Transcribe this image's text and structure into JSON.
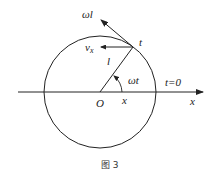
{
  "diagram": {
    "caption": "图 3",
    "labels": {
      "tangent_velocity": "ωl",
      "x_velocity": "v",
      "x_velocity_sub": "x",
      "point": "t",
      "radius": "l",
      "angle": "ωt",
      "initial": "t=0",
      "origin": "O",
      "projection": "x",
      "axis": "x"
    },
    "geometry": {
      "center": [
        100,
        92
      ],
      "radius": 56,
      "point_t": [
        133,
        47
      ],
      "axis_from": [
        18,
        92
      ],
      "axis_to": [
        203,
        92
      ]
    },
    "colors": {
      "stroke": "#222222",
      "background": "#ffffff"
    }
  }
}
